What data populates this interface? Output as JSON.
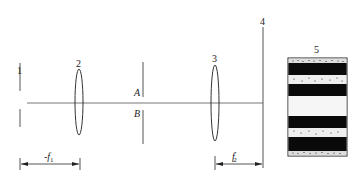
{
  "diagram": {
    "type": "optical-setup",
    "elements": [
      {
        "id": "1",
        "label": "1",
        "kind": "source-slit"
      },
      {
        "id": "2",
        "label": "2",
        "kind": "lens"
      },
      {
        "id": "AB",
        "kind": "aperture",
        "labels": {
          "upper": "A",
          "lower": "B"
        }
      },
      {
        "id": "3",
        "label": "3",
        "kind": "lens"
      },
      {
        "id": "4",
        "label": "4",
        "kind": "image-plane"
      },
      {
        "id": "5",
        "label": "5",
        "kind": "fringe-pattern"
      }
    ],
    "dimensions": [
      {
        "label_main": "-f",
        "label_sub": "1",
        "from": "1",
        "to": "2"
      },
      {
        "label_main": "f",
        "label_sub": "2",
        "label_sup": "′",
        "from": "3",
        "to": "4"
      }
    ],
    "fringe_pattern_bands": [
      "speckled",
      "dark",
      "speckled",
      "dark",
      "light",
      "dark",
      "speckled",
      "dark",
      "speckled"
    ],
    "colors": {
      "line": "#555555",
      "dark_band": "#0a0a0a",
      "light_band": "#f4f4f4"
    }
  }
}
